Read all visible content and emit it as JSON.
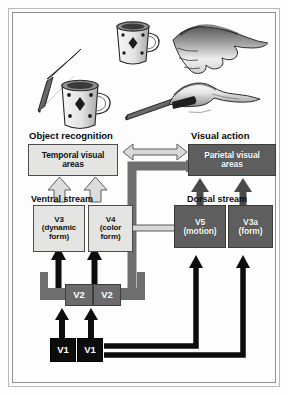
{
  "figure": {
    "kind": "two-visual-streams-diagram",
    "top_scene": {
      "description": "Line drawings: a mug and a pen viewed as objects (left) and a hand reaching to grasp the mug and a hand holding the pen (right)",
      "items": [
        {
          "name": "mug-upper",
          "label": "mug"
        },
        {
          "name": "hand-grasping-mug",
          "label": "hand grasping mug"
        },
        {
          "name": "pen-left",
          "label": "pen"
        },
        {
          "name": "mug-lower",
          "label": "mug"
        },
        {
          "name": "pen-right",
          "label": "pen"
        },
        {
          "name": "hand-holding-pen",
          "label": "hand holding pen"
        }
      ]
    },
    "headings": {
      "left": "Object recognition",
      "right": "Visual action"
    },
    "stream_labels": {
      "ventral": "Ventral stream",
      "dorsal": "Dorsal stream"
    },
    "boxes": {
      "temporal": {
        "line1": "Temporal visual",
        "line2": "areas",
        "style": "light"
      },
      "parietal": {
        "line1": "Parietal visual",
        "line2": "areas",
        "style": "dark"
      },
      "v3": {
        "line1": "V3",
        "line2": "(dynamic",
        "line3": "form)",
        "style": "light"
      },
      "v4": {
        "line1": "V4",
        "line2": "(color",
        "line3": "form)",
        "style": "light"
      },
      "v5": {
        "line1": "V5",
        "line2": "(motion)",
        "style": "dark"
      },
      "v3a": {
        "line1": "V3a",
        "line2": "(form)",
        "style": "dark"
      },
      "v2_left": {
        "line1": "V2",
        "style": "mid"
      },
      "v2_right": {
        "line1": "V2",
        "style": "mid"
      },
      "v1_left": {
        "line1": "V1",
        "style": "black"
      },
      "v1_right": {
        "line1": "V1",
        "style": "black"
      }
    },
    "connections": [
      {
        "name": "temporal-parietal-bidirectional",
        "from": "Temporal visual areas",
        "to": "Parietal visual areas",
        "arrow": "double",
        "tone": "light"
      },
      {
        "name": "v4-v5-bidirectional",
        "from": "V4 (color form)",
        "to": "V5 (motion)",
        "arrow": "double",
        "tone": "light"
      },
      {
        "name": "v3-to-temporal",
        "from": "V3 (dynamic form)",
        "to": "Temporal visual areas",
        "arrow": "single-up",
        "tone": "light"
      },
      {
        "name": "v4-to-temporal",
        "from": "V4 (color form)",
        "to": "Temporal visual areas",
        "arrow": "single-up",
        "tone": "light"
      },
      {
        "name": "v5-to-parietal",
        "from": "V5 (motion)",
        "to": "Parietal visual areas",
        "arrow": "single-up",
        "tone": "dark"
      },
      {
        "name": "v3a-to-parietal",
        "from": "V3a (form)",
        "to": "Parietal visual areas",
        "arrow": "single-up",
        "tone": "dark"
      },
      {
        "name": "v2-to-v3",
        "from": "V2",
        "to": "V3 (dynamic form)",
        "arrow": "single-up",
        "tone": "dark"
      },
      {
        "name": "v2-to-v4",
        "from": "V2",
        "to": "V4 (color form)",
        "arrow": "single-up",
        "tone": "dark"
      },
      {
        "name": "v2-to-parietal",
        "from": "V2",
        "to": "Parietal visual areas",
        "arrow": "single-right",
        "tone": "grey"
      },
      {
        "name": "v1-to-v2-left",
        "from": "V1",
        "to": "V2",
        "arrow": "single-up",
        "tone": "black"
      },
      {
        "name": "v1-to-v2-right",
        "from": "V1",
        "to": "V2",
        "arrow": "single-up",
        "tone": "black"
      },
      {
        "name": "v1-to-v5",
        "from": "V1",
        "to": "V5 (motion)",
        "arrow": "single-up",
        "tone": "black"
      },
      {
        "name": "v1-to-v3a",
        "from": "V1",
        "to": "V3a (form)",
        "arrow": "single-up",
        "tone": "black"
      }
    ],
    "colors": {
      "box_light": "#e4e4e2",
      "box_dark": "#5e5e5e",
      "box_mid": "#6b6b6b",
      "box_black": "#0d0d0d",
      "connector_black": "#0d0d0d",
      "connector_grey": "#6e6e6e",
      "connector_light": "#c9c9c9",
      "frame": "#8d8d8d"
    }
  }
}
